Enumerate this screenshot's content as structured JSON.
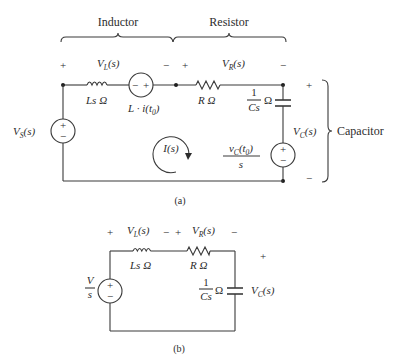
{
  "figure": {
    "part_a": {
      "caption": "(a)",
      "group_labels": {
        "inductor": "Inductor",
        "resistor": "Resistor",
        "capacitor": "Capacitor"
      },
      "source_voltage": {
        "main": "V",
        "sub": "S",
        "arg": "(s)",
        "plus": "+",
        "minus": "−"
      },
      "inductor_voltage": {
        "main": "V",
        "sub": "L",
        "arg": "(s)",
        "plus": "+",
        "minus": "−"
      },
      "resistor_voltage": {
        "main": "V",
        "sub": "R",
        "arg": "(s)",
        "plus": "+",
        "minus": "−"
      },
      "capacitor_voltage": {
        "main": "V",
        "sub": "C",
        "arg": "(s)",
        "plus": "+",
        "minus": "−"
      },
      "inductor_impedance": "Ls Ω",
      "inductor_ic_source": {
        "text": "L · i(t",
        "sub": "0",
        "close": ")",
        "plus": "+",
        "minus": "−"
      },
      "resistor_impedance": "R Ω",
      "capacitor_impedance": {
        "num": "1",
        "den": "Cs",
        "unit": "Ω"
      },
      "capacitor_ic_source": {
        "num_main": "v",
        "num_sub": "C",
        "num_arg": "(t",
        "num_arg_sub": "0",
        "num_close": ")",
        "den": "s",
        "plus": "+",
        "minus": "−"
      },
      "loop_current": "I(s)"
    },
    "part_b": {
      "caption": "(b)",
      "source": {
        "num": "V",
        "den": "s",
        "plus": "+",
        "minus": "−"
      },
      "inductor_voltage": {
        "main": "V",
        "sub": "L",
        "arg": "(s)",
        "plus": "+",
        "minus": "−"
      },
      "resistor_voltage": {
        "main": "V",
        "sub": "R",
        "arg": "(s)",
        "plus": "+",
        "minus": "−"
      },
      "capacitor_voltage": {
        "main": "V",
        "sub": "C",
        "arg": "(s)",
        "plus": "+"
      },
      "inductor_impedance": "Ls Ω",
      "resistor_impedance": "R Ω",
      "capacitor_impedance": {
        "num": "1",
        "den": "Cs",
        "unit": "Ω"
      }
    }
  }
}
